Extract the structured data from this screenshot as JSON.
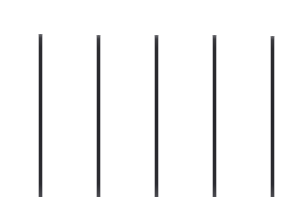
{
  "canvas": {
    "width": 304,
    "height": 205,
    "background_color": "#ffffff"
  },
  "figure": {
    "line_count": 5,
    "line_color": "#25252a",
    "line_top_color": "#6e6e73",
    "line_thickness_px": 2.5,
    "spacing_px": 58
  },
  "lines": [
    {
      "id": "line-1",
      "x": 40.5,
      "y_top": 34,
      "y_bottom": 197,
      "height": 163,
      "thickness": 2.5
    },
    {
      "id": "line-2",
      "x": 98.5,
      "y_top": 35,
      "y_bottom": 197,
      "height": 162,
      "thickness": 2.5
    },
    {
      "id": "line-3",
      "x": 156.5,
      "y_top": 35,
      "y_bottom": 197,
      "height": 162,
      "thickness": 2.5
    },
    {
      "id": "line-4",
      "x": 214.5,
      "y_top": 35,
      "y_bottom": 197,
      "height": 162,
      "thickness": 2.5
    },
    {
      "id": "line-5",
      "x": 272.5,
      "y_top": 36,
      "y_bottom": 197,
      "height": 161,
      "thickness": 2.5
    }
  ]
}
